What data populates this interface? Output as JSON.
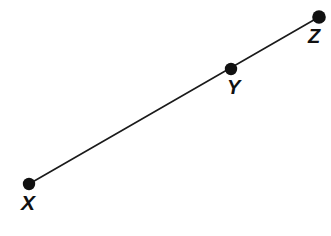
{
  "figure": {
    "kind": "geometry-diagram",
    "background_color": "#ffffff",
    "stroke_color": "#1a1a1a",
    "label_color": "#111111",
    "width": 331,
    "height": 236
  },
  "segment": {
    "name": "segment-xz",
    "stroke_width": 1.6,
    "start": {
      "x": 29,
      "y": 184
    },
    "end": {
      "x": 319,
      "y": 17
    }
  },
  "points": [
    {
      "label": "X",
      "id": "x",
      "cx": 29,
      "cy": 184,
      "r": 6.2,
      "label_position": "below"
    },
    {
      "label": "Y",
      "id": "y",
      "cx": 231,
      "cy": 69,
      "r": 6.2,
      "label_position": "below-right"
    },
    {
      "label": "Z",
      "id": "z",
      "cx": 319,
      "cy": 17,
      "r": 6.8,
      "label_position": "below-left"
    }
  ]
}
